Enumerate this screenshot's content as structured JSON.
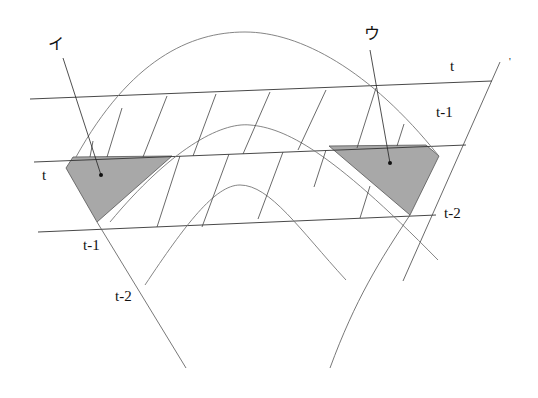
{
  "diagram": {
    "labels": {
      "i": "イ",
      "u": "ウ",
      "right_t": "t",
      "right_t1": "t-1",
      "right_t2": "t-2",
      "left_t": "t",
      "left_t1": "t-1",
      "left_t2": "t-2",
      "top_right_mark": "'"
    },
    "colors": {
      "line": "#333333",
      "curve": "#777777",
      "shaded": "#a8a8a8",
      "background": "#ffffff"
    }
  }
}
